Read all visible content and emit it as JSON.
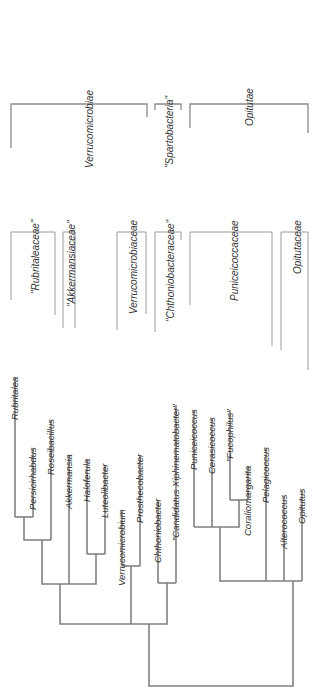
{
  "colors": {
    "line": "#8a8a8a",
    "text": "#333333",
    "background": "#ffffff"
  },
  "classes": [
    {
      "label": "Verrucomicrobiae",
      "x": 91,
      "y": 90
    },
    {
      "label": "\"Spartobacteria\"",
      "x": 171,
      "y": 96
    },
    {
      "label": "Opitutae",
      "x": 251,
      "y": 88
    }
  ],
  "families": [
    {
      "label": "\"Rubritaleaceae\"",
      "x": 37,
      "y": 220
    },
    {
      "label": "\"Akkermansiaceae\"",
      "x": 72,
      "y": 220
    },
    {
      "label": "Verrucomicrobiaceae",
      "x": 135,
      "y": 220
    },
    {
      "label": "\"Chthoniobacteraceae\"",
      "x": 172,
      "y": 220
    },
    {
      "label": "Puniceicoccaceae",
      "x": 236,
      "y": 220
    },
    {
      "label": "Opitutaceae",
      "x": 299,
      "y": 220
    }
  ],
  "leaves": [
    {
      "label": "Rubritalea",
      "x": 15,
      "top": 378
    },
    {
      "label": "Persicirhabdus",
      "x": 33,
      "top": 448
    },
    {
      "label": "Roseibacillus",
      "x": 51,
      "top": 420
    },
    {
      "label": "Akkermansia",
      "x": 69,
      "top": 455
    },
    {
      "label": "Haloferula",
      "x": 87,
      "top": 460
    },
    {
      "label": "Luteolibacter",
      "x": 105,
      "top": 465
    },
    {
      "label": "Verrucomicrobium",
      "x": 122,
      "top": 510
    },
    {
      "label": "Prosthecobacter",
      "x": 140,
      "top": 455
    },
    {
      "label": "Chthoniobacter",
      "x": 158,
      "top": 500
    },
    {
      "label": "\"Candidatus Xiphinematobacter\"",
      "x": 176,
      "top": 405
    },
    {
      "label": "Puniceicoccus",
      "x": 194,
      "top": 410
    },
    {
      "label": "Cerasicoccus",
      "x": 212,
      "top": 418
    },
    {
      "label": "\"Fucophilus\"",
      "x": 230,
      "top": 410
    },
    {
      "label": "Coraliomargarita",
      "x": 248,
      "top": 467
    },
    {
      "label": "Pelagicoccus",
      "x": 266,
      "top": 448
    },
    {
      "label": "Alterococcus",
      "x": 284,
      "top": 496
    },
    {
      "label": "Opitutus",
      "x": 302,
      "top": 490
    }
  ]
}
